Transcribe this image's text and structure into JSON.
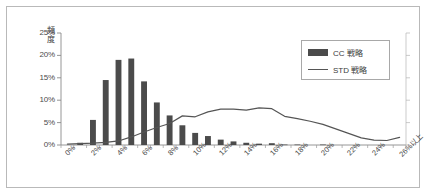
{
  "chart_data": {
    "type": "bar",
    "title": "",
    "xlabel": "",
    "ylabel": "頻度",
    "ylim": [
      0,
      25
    ],
    "ytick_labels": [
      "0%",
      "5%",
      "10%",
      "15%",
      "20%",
      "25%"
    ],
    "ytick_values": [
      0,
      5,
      10,
      15,
      20,
      25
    ],
    "grid": false,
    "legend_position": "top-right",
    "categories": [
      "0%",
      "1%",
      "2%",
      "3%",
      "4%",
      "5%",
      "6%",
      "7%",
      "8%",
      "9%",
      "10%",
      "11%",
      "12%",
      "13%",
      "14%",
      "15%",
      "16%",
      "17%",
      "18%",
      "19%",
      "20%",
      "21%",
      "22%",
      "23%",
      "24%",
      "25%",
      "26%以上"
    ],
    "xtick_labels": [
      "0%",
      "2%",
      "4%",
      "6%",
      "8%",
      "10%",
      "12%",
      "14%",
      "16%",
      "18%",
      "20%",
      "22%",
      "24%",
      "26%以上"
    ],
    "xtick_values": [
      0,
      2,
      4,
      6,
      8,
      10,
      12,
      14,
      16,
      18,
      20,
      22,
      24,
      26
    ],
    "series": [
      {
        "name": "CC 戦略",
        "type": "bar",
        "color": "#4b4b4b",
        "values": [
          0.0,
          0.5,
          5.6,
          14.5,
          19.0,
          19.3,
          14.2,
          9.5,
          6.6,
          4.4,
          2.7,
          2.0,
          1.2,
          0.8,
          0.5,
          0.3,
          0.4,
          0.1,
          0.1,
          0.0,
          0.1,
          0.0,
          0.0,
          0.0,
          0.0,
          0.0,
          0.0
        ]
      },
      {
        "name": "STD 戦略",
        "type": "line",
        "color": "#555555",
        "values": [
          0.2,
          0.3,
          0.4,
          0.6,
          0.9,
          1.8,
          2.9,
          3.9,
          4.8,
          6.5,
          6.3,
          7.4,
          8.0,
          8.0,
          7.8,
          8.3,
          8.1,
          6.4,
          5.9,
          5.3,
          4.6,
          3.6,
          2.6,
          1.6,
          1.1,
          1.0,
          1.7
        ]
      }
    ]
  },
  "legend": {
    "entries": [
      {
        "label": "CC 戦略",
        "marker": "bar-swatch"
      },
      {
        "label": "STD 戦略",
        "marker": "line-swatch"
      }
    ]
  },
  "axes": {
    "y_title": "頻度"
  }
}
